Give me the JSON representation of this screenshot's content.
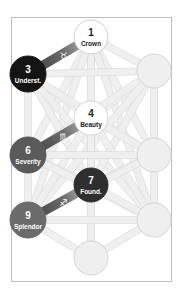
{
  "title": "",
  "colors": {
    "frame_border": "#bdbdbd",
    "path_fill": "#efefef",
    "path_stroke": "#d9d9d9",
    "inactive_node_fill": "#efefef",
    "inactive_node_stroke": "#d4d4d4",
    "highlight_path_dark": "#3a3a3a",
    "highlight_path_light": "#bdbdbd"
  },
  "nodes": [
    {
      "id": "crown",
      "number": "1",
      "label": "Crown",
      "cx": 91,
      "cy": 37,
      "r": 17,
      "fill": "#ffffff",
      "stroke": "#cfcfcf",
      "text_color": "#222222",
      "active": true
    },
    {
      "id": "understanding",
      "number": "3",
      "label": "Underst.",
      "cx": 28,
      "cy": 74,
      "r": 18,
      "fill": "#141414",
      "stroke": "#141414",
      "text_color": "#ffffff",
      "active": true
    },
    {
      "id": "right-top",
      "number": "",
      "label": "",
      "cx": 154,
      "cy": 71,
      "r": 17,
      "fill": "#efefef",
      "stroke": "#d4d4d4",
      "text_color": "#222222",
      "active": false
    },
    {
      "id": "beauty",
      "number": "4",
      "label": "Beauty",
      "cx": 91,
      "cy": 118,
      "r": 17,
      "fill": "#ffffff",
      "stroke": "#d6d6d6",
      "text_color": "#222222",
      "active": true
    },
    {
      "id": "severity",
      "number": "6",
      "label": "Severity",
      "cx": 28,
      "cy": 155,
      "r": 18,
      "fill": "#5a5a5a",
      "stroke": "#5a5a5a",
      "text_color": "#ffffff",
      "active": true
    },
    {
      "id": "right-mid",
      "number": "",
      "label": "",
      "cx": 154,
      "cy": 155,
      "r": 17,
      "fill": "#efefef",
      "stroke": "#d4d4d4",
      "text_color": "#222222",
      "active": false
    },
    {
      "id": "foundation",
      "number": "7",
      "label": "Found.",
      "cx": 91,
      "cy": 185,
      "r": 17,
      "fill": "#2f2f2f",
      "stroke": "#2f2f2f",
      "text_color": "#ffffff",
      "active": true
    },
    {
      "id": "splendor",
      "number": "9",
      "label": "Splendor",
      "cx": 28,
      "cy": 220,
      "r": 18,
      "fill": "#6b6b6b",
      "stroke": "#6b6b6b",
      "text_color": "#ffffff",
      "active": true
    },
    {
      "id": "right-low",
      "number": "",
      "label": "",
      "cx": 154,
      "cy": 220,
      "r": 17,
      "fill": "#efefef",
      "stroke": "#d4d4d4",
      "text_color": "#222222",
      "active": false
    },
    {
      "id": "bottom",
      "number": "",
      "label": "",
      "cx": 91,
      "cy": 258,
      "r": 17,
      "fill": "#efefef",
      "stroke": "#d4d4d4",
      "text_color": "#222222",
      "active": false
    }
  ],
  "highlighted_paths": [
    {
      "from": "crown",
      "to": "understanding",
      "glyph": "♉",
      "glyph_name": "taurus-icon"
    },
    {
      "from": "beauty",
      "to": "severity",
      "glyph": "♏",
      "glyph_name": "scorpio-icon"
    },
    {
      "from": "foundation",
      "to": "splendor",
      "glyph": "♐",
      "glyph_name": "sagittarius-icon"
    }
  ],
  "background_paths": [
    [
      "crown",
      "right-top"
    ],
    [
      "crown",
      "beauty"
    ],
    [
      "crown",
      "severity"
    ],
    [
      "crown",
      "right-mid"
    ],
    [
      "crown",
      "foundation"
    ],
    [
      "crown",
      "splendor"
    ],
    [
      "crown",
      "right-low"
    ],
    [
      "understanding",
      "right-top"
    ],
    [
      "understanding",
      "beauty"
    ],
    [
      "understanding",
      "severity"
    ],
    [
      "understanding",
      "right-mid"
    ],
    [
      "understanding",
      "foundation"
    ],
    [
      "understanding",
      "right-low"
    ],
    [
      "right-top",
      "beauty"
    ],
    [
      "right-top",
      "severity"
    ],
    [
      "right-top",
      "right-mid"
    ],
    [
      "right-top",
      "foundation"
    ],
    [
      "right-top",
      "splendor"
    ],
    [
      "beauty",
      "right-mid"
    ],
    [
      "beauty",
      "foundation"
    ],
    [
      "beauty",
      "splendor"
    ],
    [
      "beauty",
      "right-low"
    ],
    [
      "beauty",
      "bottom"
    ],
    [
      "severity",
      "right-mid"
    ],
    [
      "severity",
      "foundation"
    ],
    [
      "severity",
      "splendor"
    ],
    [
      "severity",
      "right-low"
    ],
    [
      "right-mid",
      "foundation"
    ],
    [
      "right-mid",
      "splendor"
    ],
    [
      "right-mid",
      "right-low"
    ],
    [
      "foundation",
      "right-low"
    ],
    [
      "foundation",
      "bottom"
    ],
    [
      "splendor",
      "right-low"
    ],
    [
      "splendor",
      "bottom"
    ],
    [
      "right-low",
      "bottom"
    ]
  ]
}
